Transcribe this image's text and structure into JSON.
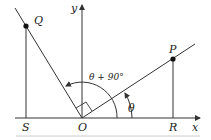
{
  "diagram": {
    "type": "coordinate-rotation",
    "labels": {
      "x_axis": "x",
      "y_axis": "y",
      "origin": "O",
      "point_p": "P",
      "point_q": "Q",
      "point_r": "R",
      "point_s": "S",
      "angle_theta": "θ",
      "angle_theta_plus_90": "θ + 90°"
    },
    "colors": {
      "line": "#333333",
      "point": "#111111",
      "rule": "#cccccc"
    }
  }
}
